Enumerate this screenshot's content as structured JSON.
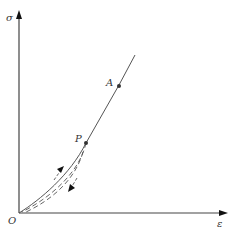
{
  "diagram": {
    "type": "stress-strain curve",
    "axes": {
      "y_label": "σ",
      "x_label": "ε",
      "origin_label": "O"
    },
    "points": [
      {
        "label": "A",
        "x": 119,
        "y": 85
      },
      {
        "label": "P",
        "x": 86,
        "y": 143
      }
    ],
    "curves": [
      {
        "name": "loading curve",
        "style": "solid"
      },
      {
        "name": "unloading curve",
        "style": "dashed"
      }
    ],
    "arrows": [
      {
        "name": "loading-direction",
        "direction": "up"
      },
      {
        "name": "unloading-direction",
        "direction": "down"
      }
    ],
    "colors": {
      "axis": "#333333",
      "curve": "#555555",
      "point": "#333333"
    }
  }
}
